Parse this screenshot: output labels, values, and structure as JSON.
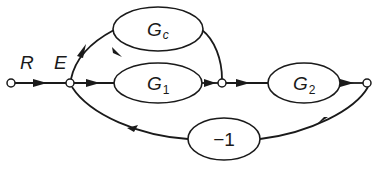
{
  "diagram": {
    "type": "signal-flow-graph",
    "nodes": {
      "input": {
        "label": "R"
      },
      "error": {
        "label": "E"
      }
    },
    "blocks": {
      "gc": {
        "main": "G",
        "sub": "c"
      },
      "g1": {
        "main": "G",
        "sub": "1"
      },
      "g2": {
        "main": "G",
        "sub": "2"
      },
      "feedback": {
        "text": "−1"
      }
    },
    "edges": [
      {
        "from": "R",
        "to": "E"
      },
      {
        "from": "E",
        "to": "Gc"
      },
      {
        "from": "E",
        "to": "G1"
      },
      {
        "from": "Gc",
        "to": "sum"
      },
      {
        "from": "G1",
        "to": "sum"
      },
      {
        "from": "sum",
        "to": "G2"
      },
      {
        "from": "G2",
        "to": "output"
      },
      {
        "from": "output",
        "to": "−1"
      },
      {
        "from": "−1",
        "to": "E"
      }
    ],
    "colors": {
      "ink": "#1a1a1a",
      "background": "#ffffff"
    }
  }
}
